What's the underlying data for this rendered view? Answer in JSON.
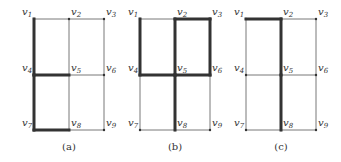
{
  "panels": [
    {
      "id": "a",
      "caption": "(a)",
      "x0": 34,
      "thick": [
        [
          "v1",
          "v4"
        ],
        [
          "v4",
          "v7"
        ],
        [
          "v4",
          "v5"
        ],
        [
          "v7",
          "v8"
        ]
      ]
    },
    {
      "id": "b",
      "caption": "(b)",
      "x0": 140,
      "thick": [
        [
          "v1",
          "v4"
        ],
        [
          "v2",
          "v3"
        ],
        [
          "v2",
          "v5"
        ],
        [
          "v3",
          "v6"
        ],
        [
          "v4",
          "v5"
        ],
        [
          "v5",
          "v6"
        ],
        [
          "v5",
          "v8"
        ]
      ]
    },
    {
      "id": "c",
      "caption": "(c)",
      "x0": 246,
      "thick": [
        [
          "v1",
          "v2"
        ],
        [
          "v2",
          "v5"
        ],
        [
          "v5",
          "v8"
        ]
      ]
    }
  ],
  "vertices": [
    "v1",
    "v2",
    "v3",
    "v4",
    "v5",
    "v6",
    "v7",
    "v8",
    "v9"
  ],
  "colors": {
    "thin": "#555555",
    "thick": "#333333"
  }
}
